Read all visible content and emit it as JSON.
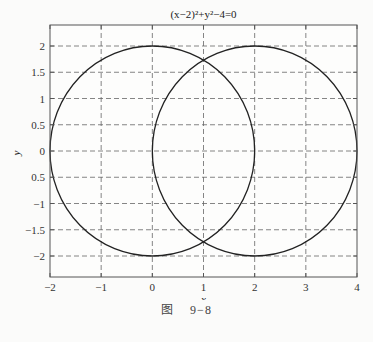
{
  "chart_data": {
    "type": "line",
    "title": "(x−2)²+y²−4=0",
    "xlabel": "x",
    "ylabel": "y",
    "xlim": [
      -2,
      4
    ],
    "ylim": [
      -2.4,
      2.4
    ],
    "xticks": [
      -2,
      -1,
      0,
      1,
      2,
      3,
      4
    ],
    "xtick_labels": [
      "−2",
      "−1",
      "0",
      "1",
      "2",
      "3",
      "4"
    ],
    "yticks": [
      2,
      1.5,
      1,
      0.5,
      0,
      -0.5,
      -1,
      -1.5,
      -2
    ],
    "ytick_labels": [
      "2",
      "1.5",
      "1",
      "0.5",
      "0",
      "0.5",
      "−1",
      "−1.5",
      "−2"
    ],
    "grid": true,
    "grid_style": "dashed",
    "series": [
      {
        "name": "x²+y²−4=0",
        "shape": "circle",
        "center": [
          0,
          0
        ],
        "radius": 2,
        "color": "#222222"
      },
      {
        "name": "(x−2)²+y²−4=0",
        "shape": "circle",
        "center": [
          2,
          0
        ],
        "radius": 2,
        "color": "#222222"
      }
    ],
    "intersections": [
      [
        1,
        1.732
      ],
      [
        1,
        -1.732
      ]
    ]
  },
  "caption": {
    "prefix": "图",
    "number": "9−8"
  }
}
